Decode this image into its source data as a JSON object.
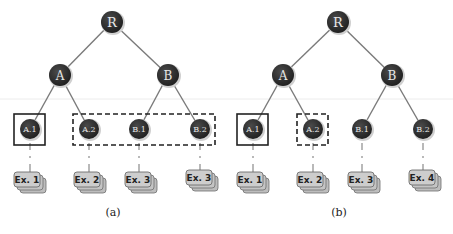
{
  "colors": {
    "node_fill": "#2b2b2b",
    "node_ring": "#c8c8c8",
    "edge": "#7a7a7a",
    "box": "#222222",
    "ex_fill": "#c9c9c9",
    "ex_border": "#6e6e6e",
    "divider": "#e6e6e6"
  },
  "panels": [
    {
      "caption": "(a)",
      "root": {
        "label": "R"
      },
      "internal": [
        {
          "label": "A"
        },
        {
          "label": "B"
        }
      ],
      "leaves": [
        {
          "label": "A.1",
          "example": "Ex. 1"
        },
        {
          "label": "A.2",
          "example": "Ex. 2"
        },
        {
          "label": "B.1",
          "example": "Ex. 3"
        },
        {
          "label": "B.2",
          "example": "Ex. 3"
        }
      ],
      "solid_box": "A.1",
      "dashed_box": "A.2, B.1, B.2"
    },
    {
      "caption": "(b)",
      "root": {
        "label": "R"
      },
      "internal": [
        {
          "label": "A"
        },
        {
          "label": "B"
        }
      ],
      "leaves": [
        {
          "label": "A.1",
          "example": "Ex. 1"
        },
        {
          "label": "A.2",
          "example": "Ex. 2"
        },
        {
          "label": "B.1",
          "example": "Ex. 3"
        },
        {
          "label": "B.2",
          "example": "Ex. 4"
        }
      ],
      "solid_box": "A.1",
      "dashed_box": "A.2"
    }
  ]
}
